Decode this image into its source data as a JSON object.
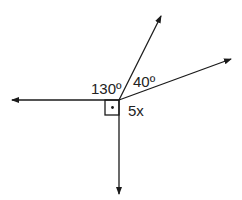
{
  "diagram": {
    "type": "angles-at-a-point",
    "labels": {
      "angle_a": "130º",
      "angle_b": "40º",
      "angle_c": "5x"
    },
    "right_angle_marker": true,
    "rays": [
      "left",
      "down",
      "upper",
      "right-upper"
    ],
    "stroke_color": "#1a1a1a"
  }
}
